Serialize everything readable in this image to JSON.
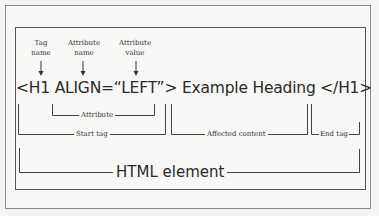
{
  "labels_top": {
    "tag_name": [
      "Tag",
      "name"
    ],
    "attribute_name": [
      "Attribute",
      "name"
    ],
    "attribute_value": [
      "Attribute",
      "value"
    ]
  },
  "code_line": "<H1 ALIGN=“LEFT”> Example Heading </H1>",
  "brackets": {
    "attribute": "Attribute",
    "start_tag": "Start tag",
    "affected_content": "Affected content",
    "end_tag": "End tag",
    "html_element": "HTML element"
  }
}
